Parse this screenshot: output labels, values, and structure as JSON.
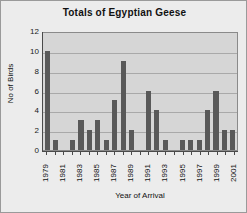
{
  "chart_data": {
    "type": "bar",
    "title": "Totals of Egyptian Geese",
    "xlabel": "Year of Arrival",
    "ylabel": "No of Birds",
    "categories": [
      "1979",
      "1980",
      "1981",
      "1982",
      "1983",
      "1984",
      "1985",
      "1986",
      "1987",
      "1988",
      "1989",
      "1990",
      "1991",
      "1992",
      "1993",
      "1994",
      "1995",
      "1996",
      "1997",
      "1998",
      "1999",
      "2000",
      "2001"
    ],
    "values": [
      10,
      1,
      0,
      1,
      3,
      2,
      3,
      1,
      5,
      9,
      2,
      0,
      6,
      4,
      1,
      0,
      1,
      1,
      1,
      4,
      6,
      2,
      2
    ],
    "tick_labels_x": [
      "1979",
      "",
      "1981",
      "",
      "1983",
      "",
      "1985",
      "",
      "1987",
      "",
      "1989",
      "",
      "1991",
      "",
      "1993",
      "",
      "1995",
      "",
      "1997",
      "",
      "1999",
      "",
      "2001"
    ],
    "ylim": [
      0,
      12
    ],
    "yticks": [
      0,
      2,
      4,
      6,
      8,
      10,
      12
    ],
    "grid": true,
    "legend": false,
    "bar_color": "#595959",
    "plot_background": "#d6d6d6",
    "figure_background": "#ececec",
    "axis_color": "#4a4a4a",
    "gridline_color": "#a9a9a9"
  }
}
